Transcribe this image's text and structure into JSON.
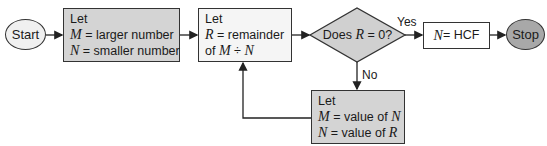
{
  "colors": {
    "start_fill": "#f0f0f0",
    "grey_box_fill": "#d4d4d4",
    "white_box_fill": "#f5f5f5",
    "diamond_fill": "#d0d0d0",
    "stop_fill": "#a8a8a8",
    "stroke": "#333333"
  },
  "nodes": {
    "start": {
      "label": "Start"
    },
    "assign_mn": {
      "line1": "Let",
      "line2_var": "M",
      "line2_text": " = larger number",
      "line3_var": "N",
      "line3_text": " = smaller number"
    },
    "remainder": {
      "line1": "Let",
      "line2_var": "R",
      "line2_text": " = remainder",
      "line3_prefix": "of ",
      "line3_var1": "M",
      "line3_op": " ÷ ",
      "line3_var2": "N"
    },
    "decision": {
      "prefix": "Does ",
      "var": "R",
      "suffix": " = 0?"
    },
    "result": {
      "var": "N",
      "text": " = HCF"
    },
    "stop": {
      "label": "Stop"
    },
    "swap": {
      "line1": "Let",
      "line2_var": "M",
      "line2_text": " = value of ",
      "line2_var2": "N",
      "line3_var": "N",
      "line3_text": " = value of ",
      "line3_var2": "R"
    }
  },
  "edges": {
    "yes_label": "Yes",
    "no_label": "No"
  }
}
